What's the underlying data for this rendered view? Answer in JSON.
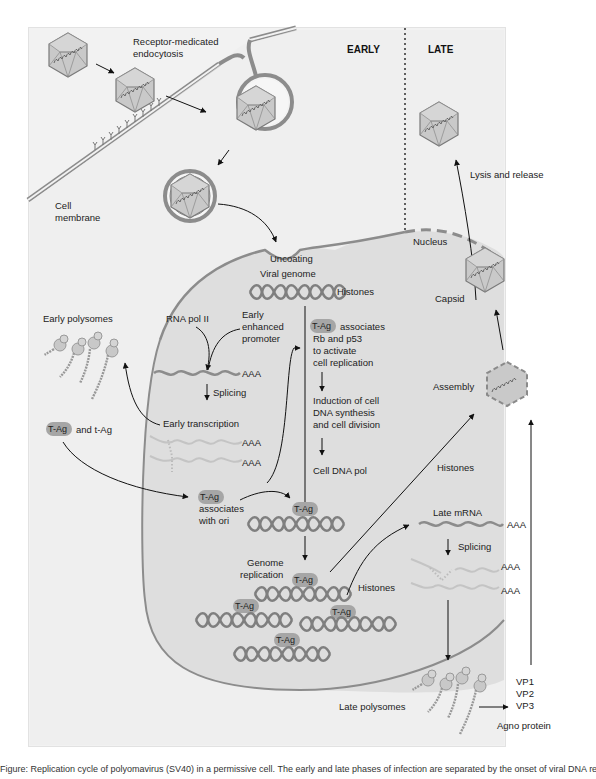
{
  "headers": {
    "early": "EARLY",
    "late": "LATE"
  },
  "labels": {
    "receptor_line1": "Receptor-medicated",
    "receptor_line2": "endocytosis",
    "cell_membrane_line1": "Cell",
    "cell_membrane_line2": "membrane",
    "uncoating": "Uncoating",
    "viral_genome": "Viral genome",
    "histones_top": "Histones",
    "nucleus": "Nucleus",
    "capsid": "Capsid",
    "lysis": "Lysis and release",
    "assembly": "Assembly",
    "early_polysomes": "Early polysomes",
    "rna_pol": "RNA pol II",
    "early_promoter_1": "Early",
    "early_promoter_2": "enhanced",
    "early_promoter_3": "promoter",
    "aaa": "AAA",
    "splicing": "Splicing",
    "early_transcription": "Early transcription",
    "tag_and_tag": "and t-Ag",
    "tag_assoc_1": "associates",
    "tag_assoc_2": "Rb and p53",
    "tag_assoc_3": "to activate",
    "tag_assoc_4": "cell replication",
    "induction_1": "Induction of cell",
    "induction_2": "DNA synthesis",
    "induction_3": "and cell division",
    "cell_dna_pol": "Cell DNA pol",
    "ori_1": "associates",
    "ori_2": "with ori",
    "histones_mid": "Histones",
    "histones_low": "Histones",
    "late_mrna": "Late mRNA",
    "genome_rep_1": "Genome",
    "genome_rep_2": "replication",
    "late_polysomes": "Late polysomes",
    "vp1": "VP1",
    "vp2": "VP2",
    "vp3": "VP3",
    "agno": "Agno protein"
  },
  "tag_label": "T-Ag",
  "caption": "Figure: Replication cycle of polyomavirus (SV40) in a permissive cell. The early and late phases of infection are separated by the onset of viral DNA replication.",
  "colors": {
    "background": "#f2f2f2",
    "membrane": "#8c8c8c",
    "nucleus_fill": "#dedede",
    "tag_fill": "#a6a6a6",
    "arrow": "#111111"
  }
}
